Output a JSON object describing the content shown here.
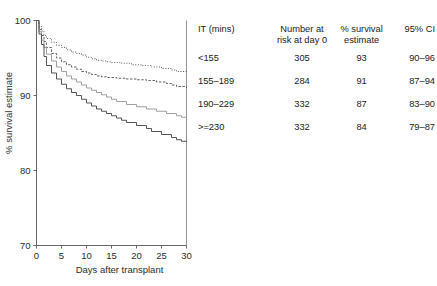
{
  "chart_data": {
    "type": "line",
    "subtype": "kaplan-meier-step",
    "title": "",
    "xlabel": "Days after transplant",
    "ylabel": "% survival estimate",
    "xlim": [
      0,
      30
    ],
    "ylim": [
      70,
      100
    ],
    "xticks": [
      "0",
      "5",
      "10",
      "15",
      "20",
      "25",
      "30"
    ],
    "yticks": [
      "70",
      "80",
      "90",
      "100"
    ],
    "grid": false,
    "legend": "none",
    "series": [
      {
        "name": "<155",
        "style": "dotted",
        "color": "#4d4d4d",
        "final_value": 93,
        "x": [
          0,
          0.5,
          1,
          1.5,
          2,
          3,
          4,
          5,
          6,
          7,
          8,
          9,
          10,
          11,
          12,
          13,
          14,
          15,
          17,
          19,
          21,
          23,
          25,
          27,
          28,
          30
        ],
        "y": [
          100,
          99.2,
          98.6,
          98.0,
          97.6,
          97.1,
          96.7,
          96.4,
          96.1,
          95.8,
          95.6,
          95.4,
          95.1,
          94.9,
          94.7,
          94.6,
          94.5,
          94.4,
          94.3,
          94.1,
          94.0,
          93.8,
          93.6,
          93.4,
          93.2,
          93.0
        ]
      },
      {
        "name": "155-189",
        "style": "dashed",
        "color": "#4d4d4d",
        "final_value": 91,
        "x": [
          0,
          0.5,
          1,
          1.5,
          2,
          3,
          4,
          5,
          6,
          7,
          8,
          9,
          10,
          11,
          12,
          13,
          14,
          16,
          18,
          20,
          22,
          24,
          26,
          27,
          28,
          30
        ],
        "y": [
          100,
          98.8,
          98.0,
          97.2,
          96.4,
          95.6,
          95.0,
          94.5,
          94.1,
          93.8,
          93.5,
          93.2,
          93.0,
          92.8,
          92.6,
          92.5,
          92.4,
          92.3,
          92.2,
          92.1,
          92.0,
          91.8,
          91.6,
          91.4,
          91.2,
          91.0
        ]
      },
      {
        "name": "190-229",
        "style": "solid",
        "color": "#9a9a9a",
        "final_value": 87,
        "x": [
          0,
          0.5,
          1,
          1.5,
          2,
          3,
          4,
          5,
          6,
          7,
          8,
          9,
          10,
          11,
          12,
          13,
          14,
          15,
          16,
          18,
          20,
          22,
          24,
          26,
          28,
          29,
          30
        ],
        "y": [
          100,
          98.5,
          97.4,
          96.4,
          95.5,
          94.6,
          93.8,
          93.2,
          92.6,
          92.2,
          91.8,
          91.4,
          91.0,
          90.7,
          90.4,
          90.1,
          89.8,
          89.5,
          89.2,
          88.8,
          88.5,
          88.2,
          87.9,
          87.6,
          87.3,
          87.1,
          87.0
        ]
      },
      {
        "name": ">=230",
        "style": "solid",
        "color": "#4a4a4a",
        "final_value": 84,
        "x": [
          0,
          0.5,
          1,
          1.5,
          2,
          3,
          4,
          5,
          6,
          7,
          8,
          9,
          10,
          11,
          12,
          13,
          14,
          15,
          16,
          17,
          18,
          20,
          22,
          23,
          25,
          27,
          28,
          29,
          30
        ],
        "y": [
          100,
          98.2,
          96.8,
          95.2,
          94.0,
          93.0,
          92.2,
          91.5,
          90.9,
          90.4,
          90.0,
          89.5,
          89.0,
          88.6,
          88.2,
          87.9,
          87.6,
          87.3,
          87.0,
          86.7,
          86.4,
          86.0,
          85.6,
          85.2,
          84.8,
          84.4,
          84.1,
          83.9,
          83.8
        ]
      }
    ]
  },
  "table": {
    "headers": [
      {
        "line1": "IT (mins)",
        "line2": ""
      },
      {
        "line1": "Number at",
        "line2": "risk at day 0"
      },
      {
        "line1": "% survival",
        "line2": "estimate"
      },
      {
        "line1": "95% CI",
        "line2": ""
      }
    ],
    "rows": [
      {
        "it": "<155",
        "n_at_risk": "305",
        "survival": "93",
        "ci": "90–96"
      },
      {
        "it": "155–189",
        "n_at_risk": "284",
        "survival": "91",
        "ci": "87–94"
      },
      {
        "it": "190–229",
        "n_at_risk": "332",
        "survival": "87",
        "ci": "83–90"
      },
      {
        "it": ">=230",
        "n_at_risk": "332",
        "survival": "84",
        "ci": "79–87"
      }
    ]
  }
}
